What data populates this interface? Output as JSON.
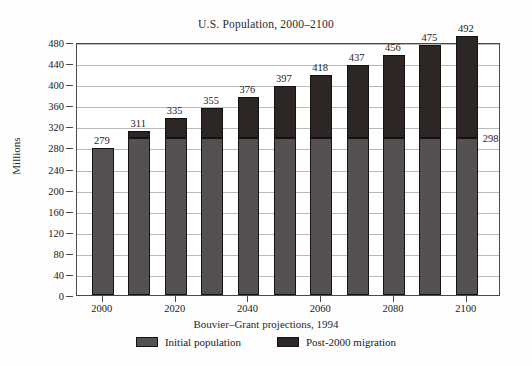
{
  "chart_data": {
    "type": "bar",
    "subtype": "stacked-bar",
    "title": "U.S. Population, 2000–2100",
    "xlabel": "Bouvier–Grant projections, 1994",
    "ylabel": "Millions",
    "ylim": [
      0,
      480
    ],
    "ytick_step": 40,
    "yticks": [
      0,
      40,
      80,
      120,
      160,
      200,
      240,
      280,
      320,
      360,
      400,
      440,
      480
    ],
    "ytick_labels": [
      "0",
      "40",
      "80",
      "120",
      "160",
      "200",
      "240",
      "280",
      "320",
      "360",
      "400",
      "440",
      "480"
    ],
    "grid": true,
    "grid_axis": "y",
    "legend_position": "below",
    "categories": [
      2000,
      2010,
      2020,
      2030,
      2040,
      2050,
      2060,
      2070,
      2080,
      2090,
      2100
    ],
    "xtick_labels": [
      "2000",
      "2020",
      "2040",
      "2060",
      "2080",
      "2100"
    ],
    "xtick_label_categories": [
      2000,
      2020,
      2040,
      2060,
      2080,
      2100
    ],
    "totals": [
      279,
      311,
      335,
      355,
      376,
      397,
      418,
      437,
      456,
      475,
      492
    ],
    "bar_value_labels": [
      "279",
      "311",
      "335",
      "355",
      "376",
      "397",
      "418",
      "437",
      "456",
      "475",
      "492"
    ],
    "series": [
      {
        "name": "Initial population",
        "color": "#555052",
        "values": [
          279,
          298,
          298,
          298,
          298,
          298,
          298,
          298,
          298,
          298,
          298
        ]
      },
      {
        "name": "Post-2000 migration",
        "color": "#2c2624",
        "values": [
          0,
          13,
          37,
          57,
          78,
          99,
          120,
          139,
          158,
          177,
          194
        ]
      }
    ],
    "annotations": [
      {
        "text": "298",
        "category": 2100,
        "value": 298,
        "note": "level of the initial (non-migration) population after 2000"
      }
    ]
  },
  "legend": {
    "entries": [
      {
        "label": "Initial population",
        "color": "#555052"
      },
      {
        "label": "Post-2000 migration",
        "color": "#2c2624"
      }
    ]
  }
}
